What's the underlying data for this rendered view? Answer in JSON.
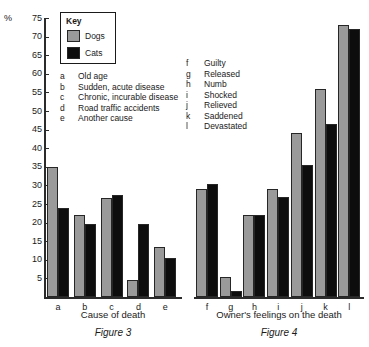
{
  "axis": {
    "percent_sign": "%",
    "ticks": [
      75,
      70,
      65,
      60,
      55,
      50,
      45,
      40,
      35,
      30,
      25,
      20,
      15,
      10,
      5
    ],
    "ylim": [
      0,
      75
    ]
  },
  "key": {
    "title": "Key",
    "entries": [
      {
        "label": "Dogs",
        "color": "#9a9a9a"
      },
      {
        "label": "Cats",
        "color": "#0d0d0d"
      }
    ]
  },
  "legend_fig3": [
    {
      "key": "a",
      "desc": "Old age"
    },
    {
      "key": "b",
      "desc": "Sudden, acute disease"
    },
    {
      "key": "c",
      "desc": "Chronic, incurable disease"
    },
    {
      "key": "d",
      "desc": "Road traffic accidents"
    },
    {
      "key": "e",
      "desc": "Another cause"
    }
  ],
  "legend_fig4": [
    {
      "key": "f",
      "desc": "Guilty"
    },
    {
      "key": "g",
      "desc": "Released"
    },
    {
      "key": "h",
      "desc": "Numb"
    },
    {
      "key": "i",
      "desc": "Shocked"
    },
    {
      "key": "j",
      "desc": "Relieved"
    },
    {
      "key": "k",
      "desc": "Saddened"
    },
    {
      "key": "l",
      "desc": "Devastated"
    }
  ],
  "fig3": {
    "caption": "Figure 3",
    "xlabel": "Cause of death"
  },
  "fig4": {
    "caption": "Figure 4",
    "xlabel": "Owner's feelings on the death"
  },
  "chart_data": [
    {
      "type": "bar",
      "title": "Figure 3",
      "xlabel": "Cause of death",
      "ylabel": "%",
      "ylim": [
        0,
        75
      ],
      "grid": false,
      "legend_position": "top-left-key-box",
      "categories": [
        "a",
        "b",
        "c",
        "d",
        "e"
      ],
      "category_descriptions": [
        "Old age",
        "Sudden, acute disease",
        "Chronic, incurable disease",
        "Road traffic accidents",
        "Another cause"
      ],
      "series": [
        {
          "name": "Dogs",
          "color": "#9a9a9a",
          "values": [
            35,
            22,
            26.5,
            4.5,
            13.5
          ]
        },
        {
          "name": "Cats",
          "color": "#0d0d0d",
          "values": [
            24,
            19.5,
            27.5,
            19.5,
            10.5
          ]
        }
      ]
    },
    {
      "type": "bar",
      "title": "Figure 4",
      "xlabel": "Owner's feelings on the death",
      "ylabel": "%",
      "ylim": [
        0,
        75
      ],
      "grid": false,
      "legend_position": "top-left-key-box",
      "categories": [
        "f",
        "g",
        "h",
        "i",
        "j",
        "k",
        "l"
      ],
      "category_descriptions": [
        "Guilty",
        "Released",
        "Numb",
        "Shocked",
        "Relieved",
        "Saddened",
        "Devastated"
      ],
      "series": [
        {
          "name": "Dogs",
          "color": "#9a9a9a",
          "values": [
            29,
            5.5,
            22,
            29,
            44,
            56,
            73
          ]
        },
        {
          "name": "Cats",
          "color": "#0d0d0d",
          "values": [
            30.5,
            1.5,
            22,
            27,
            35.5,
            46.5,
            72
          ]
        }
      ]
    }
  ]
}
